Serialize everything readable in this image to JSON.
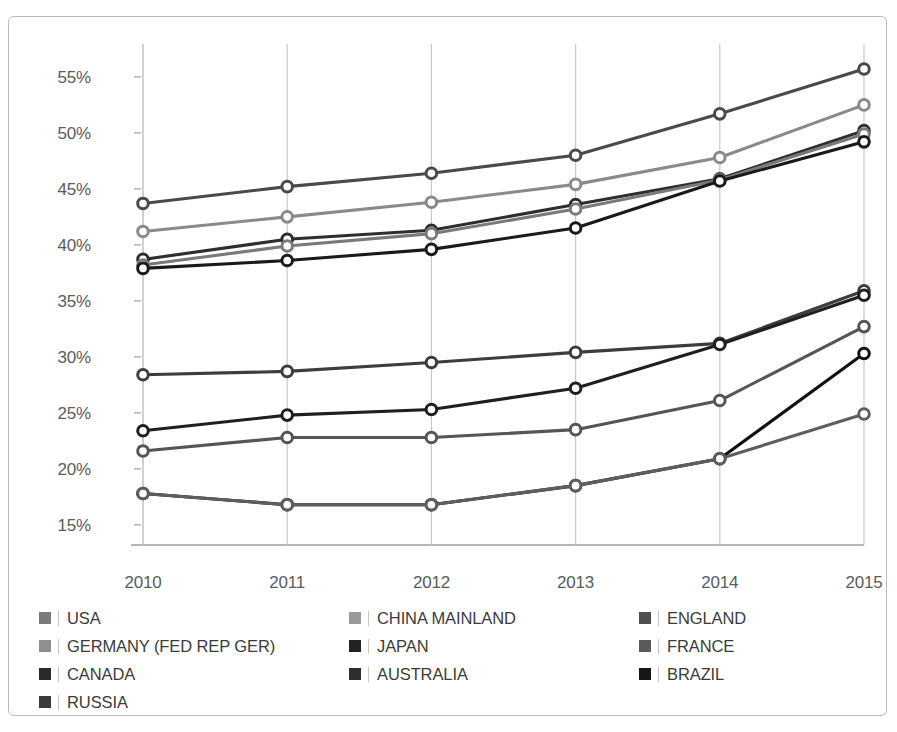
{
  "figure": {
    "top_partial_text": "",
    "background_color": "#ffffff",
    "frame_color": "#b9b9b9"
  },
  "chart_data": {
    "type": "line",
    "title": "",
    "subtitle": "",
    "xlabel": "",
    "ylabel": "",
    "categories": [
      "2010",
      "2011",
      "2012",
      "2013",
      "2014",
      "2015"
    ],
    "x": [
      2010,
      2011,
      2012,
      2013,
      2014,
      2015
    ],
    "ylim": [
      13.2,
      57.4
    ],
    "ytick_values": [
      15,
      20,
      25,
      30,
      35,
      40,
      45,
      50,
      55
    ],
    "ytick_labels": [
      "15%",
      "20%",
      "25%",
      "30%",
      "35%",
      "40%",
      "45%",
      "50%",
      "55%"
    ],
    "grid": "vertical-only",
    "grid_color": "#c9c9c9",
    "legend_position": "bottom",
    "marker": "open-circle",
    "series": [
      {
        "name": "USA",
        "color": "#4a4a4a",
        "values": [
          43.7,
          45.2,
          46.4,
          48.0,
          51.7,
          55.7
        ]
      },
      {
        "name": "CHINA MAINLAND",
        "color": "#8a8a8a",
        "values": [
          41.2,
          42.5,
          43.8,
          45.4,
          47.8,
          52.5
        ]
      },
      {
        "name": "ENGLAND",
        "color": "#2e2e2e",
        "values": [
          38.7,
          40.5,
          41.3,
          43.6,
          45.9,
          50.2
        ]
      },
      {
        "name": "GERMANY (FED REP GER)",
        "color": "#7a7a7a",
        "values": [
          38.2,
          39.9,
          41.0,
          43.2,
          45.8,
          49.9
        ]
      },
      {
        "name": "JAPAN",
        "color": "#1a1a1a",
        "values": [
          37.9,
          38.6,
          39.6,
          41.5,
          45.7,
          49.2
        ]
      },
      {
        "name": "FRANCE",
        "color": "#3d3d3d",
        "values": [
          28.4,
          28.7,
          29.5,
          30.4,
          31.2,
          35.9
        ]
      },
      {
        "name": "CANADA",
        "color": "#1f1f1f",
        "values": [
          23.4,
          24.8,
          25.3,
          27.2,
          31.1,
          35.5
        ]
      },
      {
        "name": "AUSTRALIA",
        "color": "#555555",
        "values": [
          21.6,
          22.8,
          22.8,
          23.5,
          26.1,
          32.7
        ]
      },
      {
        "name": "BRAZIL",
        "color": "#111111",
        "values": [
          17.8,
          16.8,
          16.8,
          18.5,
          20.9,
          30.3
        ]
      },
      {
        "name": "RUSSIA",
        "color": "#5e5e5e",
        "values": [
          17.8,
          16.8,
          16.8,
          18.5,
          20.9,
          24.9
        ]
      }
    ]
  },
  "legend": {
    "items": [
      {
        "label": "USA",
        "swatch_color": "#7b7b7b",
        "col": 0,
        "row": 0
      },
      {
        "label": "CHINA MAINLAND",
        "swatch_color": "#9a9a9a",
        "col": 1,
        "row": 0
      },
      {
        "label": "ENGLAND",
        "swatch_color": "#4f4f4f",
        "col": 2,
        "row": 0
      },
      {
        "label": "GERMANY (FED REP GER)",
        "swatch_color": "#8f8f8f",
        "col": 0,
        "row": 1
      },
      {
        "label": "JAPAN",
        "swatch_color": "#232323",
        "col": 1,
        "row": 1
      },
      {
        "label": "FRANCE",
        "swatch_color": "#5a5a5a",
        "col": 2,
        "row": 1
      },
      {
        "label": "CANADA",
        "swatch_color": "#2a2a2a",
        "col": 0,
        "row": 2
      },
      {
        "label": "AUSTRALIA",
        "swatch_color": "#2f2f2f",
        "col": 1,
        "row": 2
      },
      {
        "label": "BRAZIL",
        "swatch_color": "#161616",
        "col": 2,
        "row": 2
      },
      {
        "label": "RUSSIA",
        "swatch_color": "#3a3a3a",
        "col": 0,
        "row": 3
      }
    ]
  }
}
